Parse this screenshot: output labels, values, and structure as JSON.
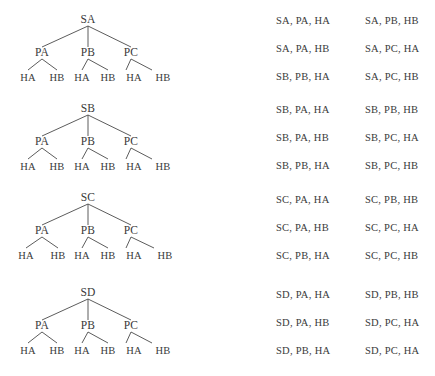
{
  "figure": {
    "type": "tree-diagram-with-enumeration",
    "background_color": "#ffffff",
    "text_color": "#3a3a3a",
    "line_color": "#4a4a4a"
  },
  "trees": [
    {
      "id": "tree-sa",
      "root": "SA",
      "mid": [
        "PA",
        "PB",
        "PC"
      ],
      "leaves": [
        "HA",
        "HB",
        "HA",
        "HB",
        "HA",
        "HB"
      ]
    },
    {
      "id": "tree-sb",
      "root": "SB",
      "mid": [
        "PA",
        "PB",
        "PC"
      ],
      "leaves": [
        "HA",
        "HB",
        "HA",
        "HB",
        "HA",
        "HB"
      ]
    },
    {
      "id": "tree-sc",
      "root": "SC",
      "mid": [
        "PA",
        "PB",
        "PC"
      ],
      "leaves": [
        "HA",
        "HB",
        "HA",
        "HB",
        "HA",
        "HB"
      ]
    },
    {
      "id": "tree-sd",
      "root": "SD",
      "mid": [
        "PA",
        "PB",
        "PC"
      ],
      "leaves": [
        "HA",
        "HB",
        "HA",
        "HB",
        "HA",
        "HB"
      ]
    }
  ],
  "combinations": [
    {
      "left": "SA, PA, HA",
      "right": "SA, PB, HB"
    },
    {
      "left": "SA, PA, HB",
      "right": "SA, PC, HA"
    },
    {
      "left": "SB, PB, HA",
      "right": "SA, PC, HB"
    },
    {
      "left": "SB, PA, HA",
      "right": "SB, PB, HB"
    },
    {
      "left": "SB, PA, HB",
      "right": "SB, PC, HA"
    },
    {
      "left": "SB, PB, HA",
      "right": "SB, PC, HB"
    },
    {
      "left": "SC, PA, HA",
      "right": "SC, PB, HB"
    },
    {
      "left": "SC, PA, HB",
      "right": "SC, PC, HA"
    },
    {
      "left": "SC, PB, HA",
      "right": "SC, PC, HB"
    },
    {
      "left": "SD, PA, HA",
      "right": "SD, PB, HB"
    },
    {
      "left": "SD, PA, HB",
      "right": "SD, PC, HA"
    },
    {
      "left": "SD, PB, HA",
      "right": "SD, PC, HA"
    }
  ]
}
